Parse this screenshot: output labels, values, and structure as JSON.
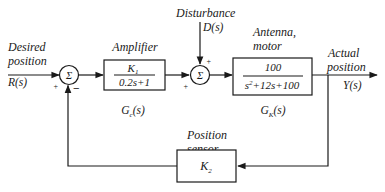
{
  "input": {
    "label_line1": "Desired",
    "label_line2": "position",
    "signal": "R(s)"
  },
  "disturbance": {
    "label": "Disturbance",
    "signal": "D(s)"
  },
  "output": {
    "label_line1": "Actual",
    "label_line2": "position",
    "signal": "Y(s)"
  },
  "summing_junction_1": {
    "symbol": "Σ",
    "sign_input": "+",
    "sign_feedback": "−"
  },
  "summing_junction_2": {
    "symbol": "Σ",
    "sign_input": "+",
    "sign_disturbance": "+"
  },
  "amplifier": {
    "title": "Amplifier",
    "numerator": "K",
    "numerator_sub": "1",
    "denominator": "0.2s+1",
    "tf_name": "G",
    "tf_sub": "c",
    "tf_arg": "(s)"
  },
  "plant": {
    "title_line1": "Antenna,",
    "title_line2": "motor",
    "numerator": "100",
    "denominator_s": "s",
    "denominator_exp": "2",
    "denominator_rest": "+12s+100",
    "tf_name": "G",
    "tf_sub": "K",
    "tf_arg": "(s)"
  },
  "sensor": {
    "title_line1": "Position",
    "title_line2": "sensor",
    "gain": "K",
    "gain_sub": "2"
  }
}
